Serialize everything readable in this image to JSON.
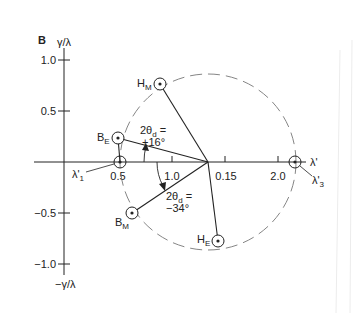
{
  "figure": {
    "panel_label": "B",
    "y_axis": {
      "top_label": "γ/λ",
      "bottom_label": "−γ/λ",
      "ticks": [
        {
          "label": "1.0",
          "y": 60
        },
        {
          "label": "0.5",
          "y": 111
        },
        {
          "label": "−0.5",
          "y": 213
        },
        {
          "label": "−1.0",
          "y": 264
        }
      ]
    },
    "x_axis": {
      "end_label": "λ'",
      "ticks": [
        {
          "label": "0.5",
          "x": 120
        },
        {
          "label": "1.0",
          "x": 172
        },
        {
          "label": "0.15",
          "x": 225
        },
        {
          "label": "2.0",
          "x": 278
        }
      ]
    },
    "circle": {
      "cx": 208,
      "cy": 162,
      "r": 88,
      "style": "dashed"
    },
    "points": [
      {
        "name": "H",
        "sub": "M",
        "x": 160,
        "y": 84
      },
      {
        "name": "B",
        "sub": "E",
        "x": 118,
        "y": 138
      },
      {
        "name": "B",
        "sub": "M",
        "x": 132,
        "y": 213
      },
      {
        "name": "H",
        "sub": "E",
        "x": 218,
        "y": 241
      },
      {
        "name": "λ'",
        "sub": "1",
        "x": 120,
        "y": 162
      },
      {
        "name": "λ'",
        "sub": "3",
        "x": 295,
        "y": 162
      }
    ],
    "angles": [
      {
        "line1": "2θ",
        "line1_sub": "d",
        "line1_suffix": " =",
        "line2": "+16°"
      },
      {
        "line1": "2θ",
        "line1_sub": "d",
        "line1_suffix": " =",
        "line2": "−34°"
      }
    ],
    "labels": {
      "hm": "H",
      "hm_sub": "M",
      "be": "B",
      "be_sub": "E",
      "bm": "B",
      "bm_sub": "M",
      "he": "H",
      "he_sub": "E",
      "l1": "λ'",
      "l1_sub": "1",
      "l3": "λ'",
      "l3_sub": "3",
      "lprime": "λ'"
    }
  }
}
